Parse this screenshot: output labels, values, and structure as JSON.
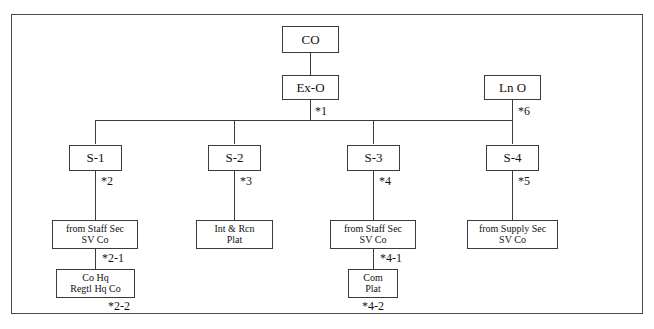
{
  "diagram": {
    "frame": {
      "border_color": "#4a4a4a"
    },
    "nodes": [
      {
        "id": "co",
        "lines": [
          "CO"
        ],
        "ref": ""
      },
      {
        "id": "exo",
        "lines": [
          "Ex-O"
        ],
        "ref": "*1"
      },
      {
        "id": "lno",
        "lines": [
          "Ln O"
        ],
        "ref": "*6"
      },
      {
        "id": "s1",
        "lines": [
          "S-1"
        ],
        "ref": "*2"
      },
      {
        "id": "s2",
        "lines": [
          "S-2"
        ],
        "ref": "*3"
      },
      {
        "id": "s3",
        "lines": [
          "S-3"
        ],
        "ref": "*4"
      },
      {
        "id": "s4",
        "lines": [
          "S-4"
        ],
        "ref": "*5"
      },
      {
        "id": "s1-staff",
        "lines": [
          "from Staff Sec",
          "SV Co"
        ],
        "ref": "*2-1"
      },
      {
        "id": "s1-cohq",
        "lines": [
          "Co Hq",
          "Regtl Hq Co"
        ],
        "ref": "*2-2"
      },
      {
        "id": "s2-intrcn",
        "lines": [
          "Int & Rcn",
          "Plat"
        ],
        "ref": ""
      },
      {
        "id": "s3-staff",
        "lines": [
          "from Staff Sec",
          "SV Co"
        ],
        "ref": "*4-1"
      },
      {
        "id": "s3-com",
        "lines": [
          "Com",
          "Plat"
        ],
        "ref": "*4-2"
      },
      {
        "id": "s4-supply",
        "lines": [
          "from Supply Sec",
          "SV Co"
        ],
        "ref": ""
      }
    ]
  }
}
